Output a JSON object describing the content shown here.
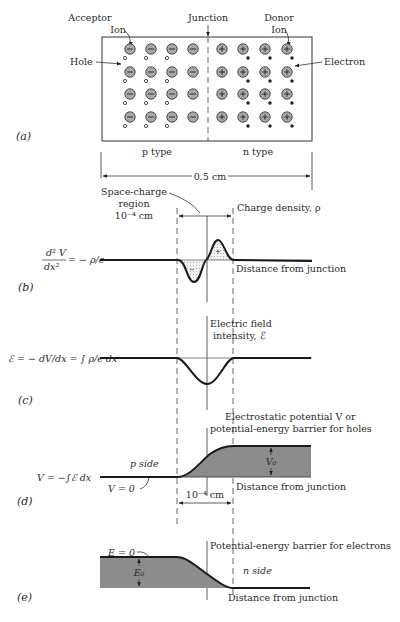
{
  "panel_a": {
    "panel_label": "(a)",
    "acceptor_label_line1": "Acceptor",
    "acceptor_label_line2": "Ion",
    "junction_label": "Junction",
    "donor_label_line1": "Donor",
    "donor_label_line2": "Ion",
    "hole_label": "Hole",
    "electron_label": "Electron",
    "p_type_label": "p type",
    "n_type_label": "n type",
    "width_label": "0.5 cm",
    "acceptor_sign": "−",
    "donor_sign": "+",
    "rows": 4,
    "acceptor_columns": 4,
    "donor_columns": 4,
    "holes_per_row_columns": 3,
    "electrons_per_row_columns": 3
  },
  "space_charge": {
    "label_line1": "Space-charge",
    "label_line2": "region",
    "label_line3": "10⁻⁴ cm"
  },
  "panel_b": {
    "panel_label": "(b)",
    "equation_num": "d² V",
    "equation_den": "dx²",
    "equation_rhs": "= − ρ/ϵ",
    "curve_label": "Charge density, ρ",
    "axis_label": "Distance from junction",
    "negative_sign": "−",
    "positive_sign": "+"
  },
  "panel_c": {
    "panel_label": "(c)",
    "equation": "ℰ = − dV/dx = ∫ ρ/ϵ dx",
    "curve_label_line1": "Electric field",
    "curve_label_line2": "intensity, ℰ"
  },
  "panel_d": {
    "panel_label": "(d)",
    "equation": "V = −∫ℰ dx",
    "curve_label_line1": "Electrostatic potential V or",
    "curve_label_line2": "potential-energy barrier for holes",
    "p_side_label": "p side",
    "v_zero_label": "V = 0",
    "barrier_label": "V₀",
    "width_label": "10⁻⁴ cm",
    "axis_label": "Distance from junction"
  },
  "panel_e": {
    "panel_label": "(e)",
    "e_zero_label": "E = 0",
    "barrier_label": "E₀",
    "curve_label": "Potential-energy barrier for electrons",
    "n_side_label": "n side",
    "axis_label": "Distance from junction"
  },
  "colors": {
    "ion_fill": "#a8a8a8",
    "barrier_fill": "#8c8c8c",
    "line": "#1a1a1a"
  }
}
